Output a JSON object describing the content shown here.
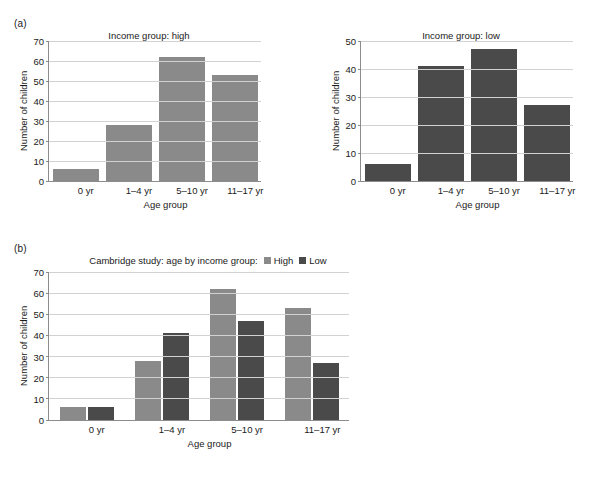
{
  "figure": {
    "panel_a_label": "(a)",
    "panel_b_label": "(b)"
  },
  "colors": {
    "high": "#8a8a8a",
    "low": "#4a4a4a",
    "gridline": "#d2d2d2",
    "axis": "#8c8c8c",
    "background": "#ffffff",
    "text": "#1a1a1a"
  },
  "chart_data": [
    {
      "id": "income-high",
      "type": "bar",
      "title": "Income group: high",
      "xlabel": "Age group",
      "ylabel": "Number of children",
      "categories": [
        "0 yr",
        "1–4 yr",
        "5–10 yr",
        "11–17 yr"
      ],
      "values": [
        6,
        28,
        62,
        53
      ],
      "series_name": "High",
      "color": "#8a8a8a",
      "ylim": [
        0,
        70
      ],
      "yticks": [
        0,
        10,
        20,
        30,
        40,
        50,
        60,
        70
      ],
      "grid": true,
      "legend": "none"
    },
    {
      "id": "income-low",
      "type": "bar",
      "title": "Income group: low",
      "xlabel": "Age group",
      "ylabel": "Number of children",
      "categories": [
        "0 yr",
        "1–4 yr",
        "5–10 yr",
        "11–17 yr"
      ],
      "values": [
        6,
        41,
        47,
        27
      ],
      "series_name": "Low",
      "color": "#4a4a4a",
      "ylim": [
        0,
        50
      ],
      "yticks": [
        0,
        10,
        20,
        30,
        40,
        50
      ],
      "grid": true,
      "legend": "none"
    },
    {
      "id": "combined",
      "type": "bar",
      "title": "Cambridge study: age by income group:",
      "xlabel": "Age group",
      "ylabel": "Number of children",
      "categories": [
        "0 yr",
        "1–4 yr",
        "5–10 yr",
        "11–17 yr"
      ],
      "series": [
        {
          "name": "High",
          "values": [
            6,
            28,
            62,
            53
          ],
          "color": "#8a8a8a"
        },
        {
          "name": "Low",
          "values": [
            6,
            41,
            47,
            27
          ],
          "color": "#4a4a4a"
        }
      ],
      "ylim": [
        0,
        70
      ],
      "yticks": [
        0,
        10,
        20,
        30,
        40,
        50,
        60,
        70
      ],
      "grid": true,
      "legend": "inline-title"
    }
  ]
}
